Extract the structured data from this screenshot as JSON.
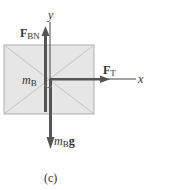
{
  "diagram": {
    "type": "free-body-diagram",
    "caption": "(c)",
    "axes": {
      "x_label": "x",
      "y_label": "y"
    },
    "body": {
      "label_main": "m",
      "label_sub": "B"
    },
    "forces": [
      {
        "name": "F_BN",
        "symbol": "F",
        "subscript": "BN",
        "direction": "up"
      },
      {
        "name": "F_T",
        "symbol": "F",
        "subscript": "T",
        "direction": "right"
      },
      {
        "name": "weight",
        "symbol_m": "m",
        "subscript": "B",
        "symbol_g": "g",
        "direction": "down"
      }
    ],
    "colors": {
      "box_fill": "#e6e6e6",
      "box_stroke": "#b0b0b0",
      "arrow": "#555555",
      "axis": "#444444"
    }
  }
}
